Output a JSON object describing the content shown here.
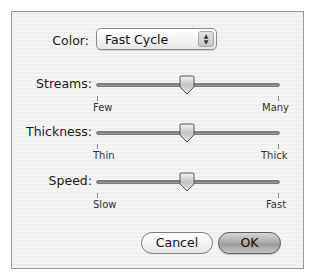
{
  "color": {
    "label": "Color:",
    "selected": "Fast Cycle"
  },
  "sliders": [
    {
      "label": "Streams:",
      "min_label": "Few",
      "max_label": "Many",
      "value_pct": 50
    },
    {
      "label": "Thickness:",
      "min_label": "Thin",
      "max_label": "Thick",
      "value_pct": 50
    },
    {
      "label": "Speed:",
      "min_label": "Slow",
      "max_label": "Fast",
      "value_pct": 50
    }
  ],
  "buttons": {
    "cancel": "Cancel",
    "ok": "OK"
  },
  "icons": {
    "popup_arrows": "up-down-arrows-icon",
    "slider_thumb": "pointer-thumb-icon"
  }
}
